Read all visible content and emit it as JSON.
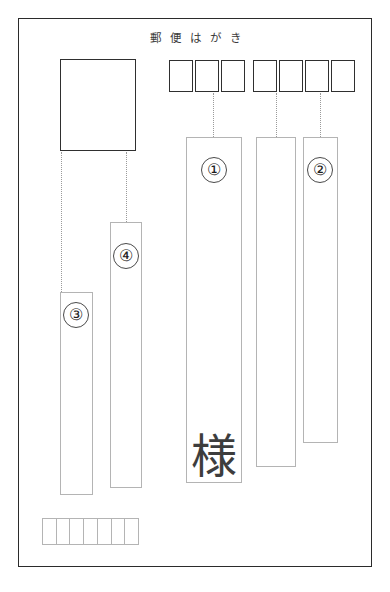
{
  "diagram": {
    "header_text": "郵便はがき",
    "honorific": "様"
  },
  "colors": {
    "card_border": "#2b2b2b",
    "zip_recipient_border": "#2f2f2f",
    "field_border": "#b4b4b4",
    "connector": "#9a9a9a",
    "text": "#1d1d1d"
  },
  "zip_recipient": {
    "name": "recipient-postal-code",
    "boxes": [
      "",
      "",
      "",
      "",
      "",
      "",
      ""
    ],
    "gap_after_index": 3
  },
  "zip_sender": {
    "name": "sender-postal-code",
    "boxes": [
      "",
      "",
      "",
      "",
      "",
      "",
      ""
    ]
  },
  "stamp": {
    "label": ""
  },
  "fields": [
    {
      "id": "addr-1",
      "marker": "①"
    },
    {
      "id": "addr-2",
      "marker": "②"
    },
    {
      "id": "addr-3",
      "marker": "③"
    },
    {
      "id": "addr-4",
      "marker": "④"
    },
    {
      "id": "addr-mid",
      "marker": ""
    }
  ],
  "markers": {
    "one": "①",
    "two": "②",
    "three": "③",
    "four": "④"
  }
}
